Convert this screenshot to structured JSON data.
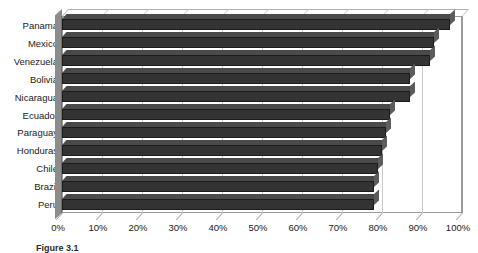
{
  "chart_data": {
    "type": "bar",
    "orientation": "horizontal",
    "title": "",
    "xlabel": "",
    "ylabel": "",
    "categories": [
      "Panama",
      "Mexico",
      "Venezuela",
      "Bolivia",
      "Nicaragua",
      "Ecuador",
      "Paraguay",
      "Honduras",
      "Chile",
      "Brazil",
      "Peru"
    ],
    "values": [
      97,
      93,
      92,
      87,
      87,
      82,
      81,
      80,
      79,
      78,
      78
    ],
    "series": [
      {
        "name": "",
        "values": [
          97,
          93,
          92,
          87,
          87,
          82,
          81,
          80,
          79,
          78,
          78
        ]
      }
    ],
    "xlim": [
      0,
      100
    ],
    "xticks": [
      0,
      10,
      20,
      30,
      40,
      50,
      60,
      70,
      80,
      90,
      100
    ],
    "xtick_labels": [
      "0%",
      "10%",
      "20%",
      "30%",
      "40%",
      "50%",
      "60%",
      "70%",
      "80%",
      "90%",
      "100%"
    ],
    "grid": true,
    "grid_axis": "x",
    "legend": false,
    "bar_color": "#333333",
    "plot_background": "#ffffff",
    "style_3d": true
  },
  "caption": {
    "text": "Figure 3.1"
  }
}
